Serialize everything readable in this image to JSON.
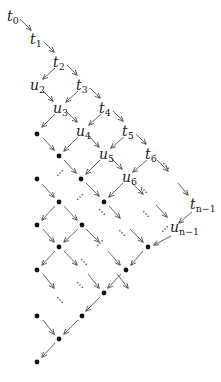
{
  "diagram": {
    "type": "lattice",
    "colors": {
      "arrow": "#555555",
      "text": "#222222",
      "dot": "#111111",
      "background": "#ffffff"
    },
    "labels": [
      {
        "id": "t0",
        "base": "t",
        "sub": "0",
        "x": 13,
        "y": 19
      },
      {
        "id": "t1",
        "base": "t",
        "sub": "1",
        "x": 36,
        "y": 42
      },
      {
        "id": "t2",
        "base": "t",
        "sub": "2",
        "x": 59,
        "y": 65
      },
      {
        "id": "t3",
        "base": "t",
        "sub": "3",
        "x": 82,
        "y": 88
      },
      {
        "id": "t4",
        "base": "t",
        "sub": "4",
        "x": 105,
        "y": 111
      },
      {
        "id": "t5",
        "base": "t",
        "sub": "5",
        "x": 128,
        "y": 134
      },
      {
        "id": "t6",
        "base": "t",
        "sub": "6",
        "x": 151,
        "y": 157
      },
      {
        "id": "tn1",
        "base": "t",
        "sub": "n−1",
        "x": 196,
        "y": 207
      },
      {
        "id": "u2",
        "base": "u",
        "sub": "2",
        "x": 36,
        "y": 88
      },
      {
        "id": "u3",
        "base": "u",
        "sub": "3",
        "x": 59,
        "y": 111
      },
      {
        "id": "u4",
        "base": "u",
        "sub": "4",
        "x": 82,
        "y": 134
      },
      {
        "id": "u5",
        "base": "u",
        "sub": "5",
        "x": 105,
        "y": 157
      },
      {
        "id": "u6",
        "base": "u",
        "sub": "6",
        "x": 128,
        "y": 180
      },
      {
        "id": "un1",
        "base": "u",
        "sub": "n−1",
        "x": 176,
        "y": 230
      }
    ],
    "dots": [
      [
        37,
        134
      ],
      [
        59,
        156
      ],
      [
        37,
        179
      ],
      [
        81,
        179
      ],
      [
        59,
        202
      ],
      [
        104,
        202
      ],
      [
        37,
        225
      ],
      [
        82,
        225
      ],
      [
        59,
        247
      ],
      [
        148,
        247
      ],
      [
        37,
        270
      ],
      [
        126,
        270
      ],
      [
        104,
        293
      ],
      [
        37,
        316
      ],
      [
        82,
        316
      ],
      [
        59,
        339
      ],
      [
        37,
        362
      ]
    ],
    "arrows": [
      [
        [
          20,
          19
        ],
        [
          31,
          30
        ]
      ],
      [
        [
          44,
          42
        ],
        [
          54,
          52
        ]
      ],
      [
        [
          55,
          68
        ],
        [
          43,
          79
        ]
      ],
      [
        [
          67,
          65
        ],
        [
          77,
          75
        ]
      ],
      [
        [
          42,
          90
        ],
        [
          53,
          101
        ]
      ],
      [
        [
          78,
          91
        ],
        [
          66,
          102
        ]
      ],
      [
        [
          90,
          88
        ],
        [
          100,
          98
        ]
      ],
      [
        [
          55,
          114
        ],
        [
          42,
          127
        ]
      ],
      [
        [
          66,
          111
        ],
        [
          77,
          122
        ]
      ],
      [
        [
          101,
          114
        ],
        [
          89,
          125
        ]
      ],
      [
        [
          113,
          111
        ],
        [
          123,
          121
        ]
      ],
      [
        [
          43,
          138
        ],
        [
          54,
          150
        ]
      ],
      [
        [
          78,
          137
        ],
        [
          64,
          151
        ]
      ],
      [
        [
          88,
          135
        ],
        [
          99,
          147
        ]
      ],
      [
        [
          124,
          137
        ],
        [
          111,
          148
        ]
      ],
      [
        [
          136,
          134
        ],
        [
          146,
          144
        ]
      ],
      [
        [
          100,
          160
        ],
        [
          86,
          174
        ]
      ],
      [
        [
          110,
          157
        ],
        [
          122,
          169
        ]
      ],
      [
        [
          147,
          160
        ],
        [
          133,
          172
        ]
      ],
      [
        [
          64,
          160
        ],
        [
          76,
          173
        ]
      ],
      [
        [
          42,
          184
        ],
        [
          54,
          197
        ]
      ],
      [
        [
          123,
          183
        ],
        [
          109,
          197
        ]
      ],
      [
        [
          86,
          183
        ],
        [
          99,
          196
        ]
      ],
      [
        [
          55,
          206
        ],
        [
          42,
          220
        ]
      ],
      [
        [
          64,
          206
        ],
        [
          77,
          220
        ]
      ],
      [
        [
          43,
          229
        ],
        [
          54,
          242
        ]
      ],
      [
        [
          78,
          229
        ],
        [
          64,
          242
        ]
      ],
      [
        [
          86,
          229
        ],
        [
          99,
          242
        ]
      ],
      [
        [
          55,
          251
        ],
        [
          42,
          265
        ]
      ],
      [
        [
          64,
          251
        ],
        [
          77,
          265
        ]
      ],
      [
        [
          43,
          274
        ],
        [
          54,
          288
        ]
      ],
      [
        [
          88,
          274
        ],
        [
          99,
          288
        ]
      ],
      [
        [
          121,
          274
        ],
        [
          108,
          288
        ]
      ],
      [
        [
          100,
          297
        ],
        [
          86,
          311
        ]
      ],
      [
        [
          43,
          320
        ],
        [
          54,
          334
        ]
      ],
      [
        [
          78,
          320
        ],
        [
          64,
          334
        ]
      ],
      [
        [
          55,
          343
        ],
        [
          42,
          357
        ]
      ],
      [
        [
          157,
          160
        ],
        [
          168,
          171
        ]
      ],
      [
        [
          178,
          183
        ],
        [
          188,
          195
        ]
      ],
      [
        [
          132,
          183
        ],
        [
          143,
          194
        ]
      ],
      [
        [
          156,
          205
        ],
        [
          167,
          217
        ]
      ],
      [
        [
          192,
          212
        ],
        [
          179,
          223
        ]
      ],
      [
        [
          171,
          236
        ],
        [
          154,
          245
        ]
      ],
      [
        [
          109,
          206
        ],
        [
          120,
          218
        ]
      ],
      [
        [
          130,
          229
        ],
        [
          143,
          242
        ]
      ],
      [
        [
          143,
          251
        ],
        [
          131,
          265
        ]
      ],
      [
        [
          108,
          251
        ],
        [
          120,
          265
        ]
      ],
      [
        [
          117,
          274
        ],
        [
          128,
          288
        ]
      ]
    ],
    "ellipses": [
      {
        "x": 166,
        "y": 166,
        "dir": "down-right"
      },
      {
        "x": 144,
        "y": 190,
        "dir": "down-right"
      },
      {
        "x": 60,
        "y": 173,
        "dir": "down-left"
      },
      {
        "x": 102,
        "y": 212,
        "dir": "down-right"
      },
      {
        "x": 80,
        "y": 197,
        "dir": "down-left"
      },
      {
        "x": 100,
        "y": 243,
        "dir": "down-left"
      },
      {
        "x": 84,
        "y": 262,
        "dir": "down-right"
      },
      {
        "x": 122,
        "y": 233,
        "dir": "down-right"
      },
      {
        "x": 146,
        "y": 214,
        "dir": "down-right"
      },
      {
        "x": 165,
        "y": 229,
        "dir": "down-left"
      },
      {
        "x": 80,
        "y": 285,
        "dir": "down-right"
      },
      {
        "x": 60,
        "y": 300,
        "dir": "down-right"
      }
    ]
  }
}
